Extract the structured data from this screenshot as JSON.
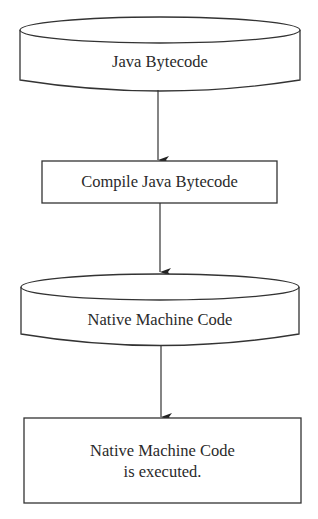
{
  "diagram": {
    "type": "flowchart",
    "colors": {
      "stroke": "#333333",
      "text": "#2a2a2a",
      "background": "#ffffff"
    },
    "nodes": [
      {
        "id": "java-bytecode",
        "shape": "cylinder",
        "label": "Java Bytecode"
      },
      {
        "id": "compile",
        "shape": "rectangle",
        "label": "Compile Java Bytecode"
      },
      {
        "id": "native-code",
        "shape": "cylinder",
        "label": "Native Machine Code"
      },
      {
        "id": "executed",
        "shape": "rectangle",
        "label_lines": [
          "Native Machine Code",
          "is executed."
        ]
      }
    ],
    "edges": [
      {
        "from": "java-bytecode",
        "to": "compile"
      },
      {
        "from": "compile",
        "to": "native-code"
      },
      {
        "from": "native-code",
        "to": "executed"
      }
    ]
  }
}
